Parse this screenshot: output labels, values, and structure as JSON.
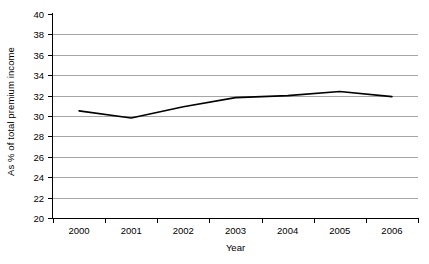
{
  "chart_data": {
    "type": "line",
    "title": "",
    "subtitle": "",
    "xlabel": "Year",
    "ylabel": "As % of total premium income",
    "categories": [
      "2000",
      "2001",
      "2002",
      "2003",
      "2004",
      "2005",
      "2006"
    ],
    "x": [
      2000,
      2001,
      2002,
      2003,
      2004,
      2005,
      2006
    ],
    "values": [
      30.5,
      29.8,
      30.9,
      31.8,
      32.0,
      32.4,
      31.9
    ],
    "series": [
      {
        "name": "As % of total premium income",
        "values": [
          30.5,
          29.8,
          30.9,
          31.8,
          32.0,
          32.4,
          31.9
        ],
        "color": "#000000"
      }
    ],
    "ylim": [
      20,
      40
    ],
    "ytick_values": [
      20,
      22,
      24,
      26,
      28,
      30,
      32,
      34,
      36,
      38,
      40
    ],
    "ytick_labels": [
      "20",
      "22",
      "24",
      "26",
      "28",
      "30",
      "32",
      "34",
      "36",
      "38",
      "40"
    ],
    "grid": true,
    "grid_color": "#a6a6a6",
    "grid_axis": "y",
    "legend": false,
    "legend_position": "none",
    "markers": false,
    "line_color": "#000000",
    "line_width": 1.6,
    "background_color": "#ffffff",
    "axis_color": "#000000",
    "annotations": []
  }
}
